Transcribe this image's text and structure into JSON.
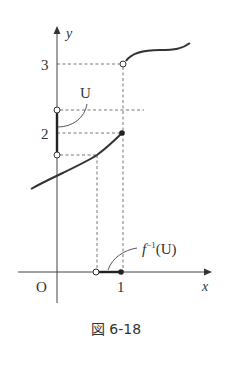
{
  "figure": {
    "caption": "図 6-18",
    "axes": {
      "x_label": "x",
      "y_label": "y",
      "origin_label": "O",
      "x_ticks": [
        "1"
      ],
      "y_ticks": [
        "2",
        "3"
      ]
    },
    "annotations": {
      "set_U": "U",
      "preimage_f": "f",
      "preimage_sup": "−1",
      "preimage_arg": "(U)"
    },
    "colors": {
      "curve": "#333333",
      "dashed": "#555555",
      "axis": "#444444"
    }
  }
}
